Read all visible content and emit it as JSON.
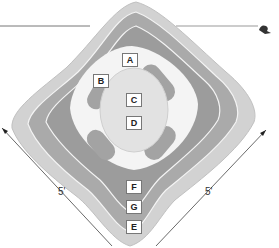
{
  "diagram": {
    "type": "layered diamond mound cross-section (top view)",
    "zones": [
      {
        "id": "A",
        "label": "A"
      },
      {
        "id": "B",
        "label": "B"
      },
      {
        "id": "C",
        "label": "C"
      },
      {
        "id": "D",
        "label": "D"
      },
      {
        "id": "E",
        "label": "E"
      },
      {
        "id": "F",
        "label": "F"
      },
      {
        "id": "G",
        "label": "G"
      }
    ],
    "dimensions": {
      "left_side": "5'",
      "right_side": "5'"
    },
    "colors": {
      "outer_ring": "#cfcfcf",
      "middle_ring": "#a9a9a9",
      "inner_ring": "#9a9a9a",
      "center": "#e4e4e4",
      "pods": "#a0a0a0",
      "line": "#555555"
    }
  }
}
